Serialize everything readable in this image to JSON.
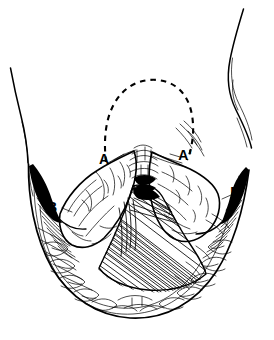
{
  "figure": {
    "domain": "medical-illustration",
    "canvas": {
      "width": 274,
      "height": 340
    },
    "colors": {
      "background": "#ffffff",
      "ink": "#000000"
    },
    "labels": [
      {
        "id": "A",
        "text": "A",
        "x": 104,
        "y": 164,
        "name": "label-a"
      },
      {
        "id": "Ap",
        "text": "A'",
        "x": 185,
        "y": 160,
        "name": "label-a-prime"
      },
      {
        "id": "B",
        "text": "B",
        "x": 52,
        "y": 212,
        "name": "label-b"
      },
      {
        "id": "Bp",
        "text": "B'",
        "x": 236,
        "y": 197,
        "name": "label-b-prime"
      }
    ],
    "annotations": {
      "dashed_outline_name": "dashed-excision-outline",
      "dashed_outline_note": "Dashed dome-shaped outline above the labeled points A and A'",
      "cavity_name": "central-hatched-cavity",
      "left_lobe_name": "left-tissue-lobe",
      "right_lobe_name": "right-tissue-lobe",
      "lower_tissue_name": "lower-fatty-tissue-field"
    },
    "body_outline": {
      "left_thigh_name": "left-thigh-contour",
      "right_thigh_name": "right-thigh-contour",
      "perineal_rim_name": "perineal-rim-contour"
    }
  }
}
